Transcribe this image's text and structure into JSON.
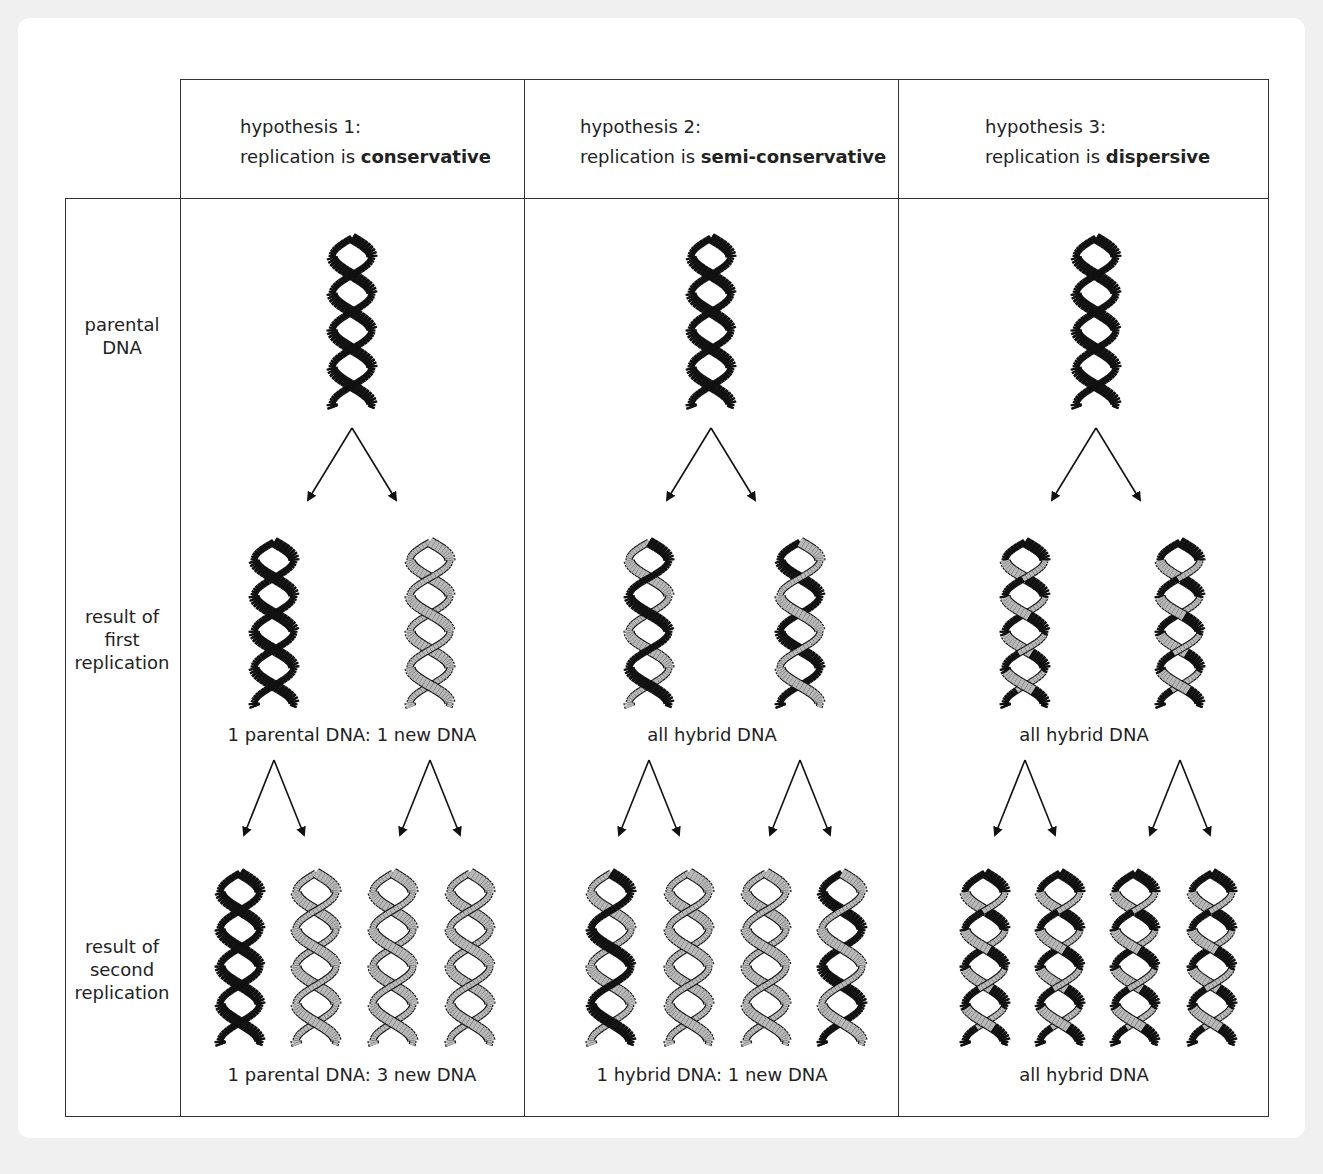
{
  "columns": [
    {
      "line1": "hypothesis 1:",
      "prefix": "replication is ",
      "term": "conservative"
    },
    {
      "line1": "hypothesis 2:",
      "prefix": "replication is ",
      "term": "semi-conservative"
    },
    {
      "line1": "hypothesis 3:",
      "prefix": "replication is ",
      "term": "dispersive"
    }
  ],
  "rows": [
    {
      "label": [
        "parental",
        "DNA"
      ]
    },
    {
      "label": [
        "result of",
        "first",
        "replication"
      ]
    },
    {
      "label": [
        "result of",
        "second",
        "replication"
      ]
    }
  ],
  "captions": {
    "first": [
      "1 parental DNA: 1 new DNA",
      "all hybrid DNA",
      "all hybrid DNA"
    ],
    "second": [
      "1 parental DNA: 3 new DNA",
      "1 hybrid DNA: 1 new DNA",
      "all hybrid DNA"
    ]
  },
  "colors": {
    "parental_strand": "#111111",
    "new_strand": "#b8b8b8",
    "outline": "#111111",
    "grid": "#333333",
    "background": "#f0f0f0",
    "card": "#ffffff"
  }
}
